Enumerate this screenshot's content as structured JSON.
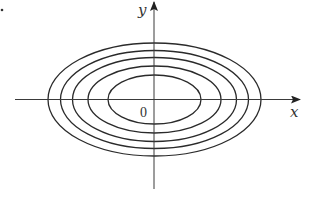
{
  "figure": {
    "type": "contour-plot",
    "axes": {
      "x_label": "x",
      "y_label": "y",
      "origin_label": "0"
    },
    "center_px": [
      154.5,
      99.5
    ],
    "ellipses_px": [
      {
        "rx": 46.5,
        "ry": 24.5
      },
      {
        "rx": 66.5,
        "ry": 33.5
      },
      {
        "rx": 82,
        "ry": 42
      },
      {
        "rx": 94,
        "ry": 49
      },
      {
        "rx": 106.5,
        "ry": 56.5
      }
    ],
    "colors": {
      "stroke": "#2a2a2a",
      "axis": "#3a3a3a",
      "background": "#ffffff"
    }
  }
}
